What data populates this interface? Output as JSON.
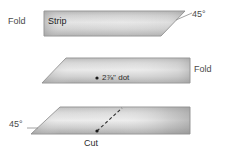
{
  "diagram": {
    "background_color": "#ffffff",
    "shape_fill_light": "#e8e8e8",
    "shape_fill_mid": "#c9c9c9",
    "shape_fill_dark": "#a8a8a8",
    "shape_stroke": "#8c8c8c",
    "label_color": "#4a4a4a",
    "marker_color": "#1a1a1a"
  },
  "steps": [
    {
      "name": "step-1-strip",
      "fold_label": "Fold",
      "strip_label": "Strip",
      "angle_label": "45°"
    },
    {
      "name": "step-2-dot",
      "dot_label": "2⅞\" dot",
      "fold_label": "Fold"
    },
    {
      "name": "step-3-cut",
      "angle_label": "45°",
      "cut_label": "Cut"
    }
  ],
  "labels": {
    "fold_left": "Fold",
    "strip": "Strip",
    "angle_top": "45°",
    "dot_measure": "2⅞\" dot",
    "fold_right": "Fold",
    "angle_bottom": "45°",
    "cut": "Cut"
  }
}
